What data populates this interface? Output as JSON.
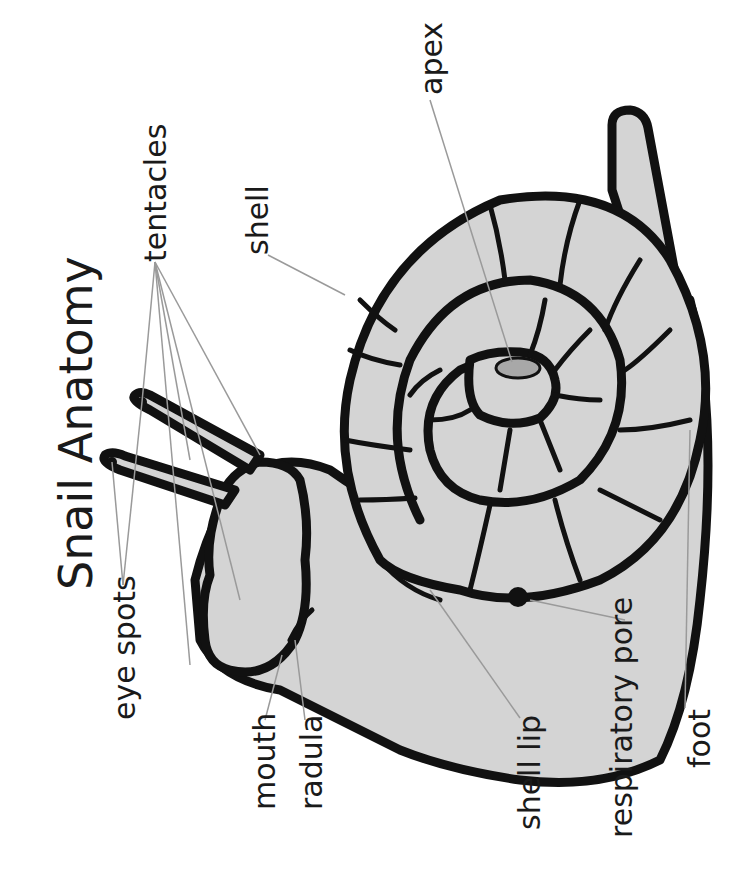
{
  "title": "Snail Anatomy",
  "labels": {
    "tentacles": "tentacles",
    "shell": "shell",
    "apex": "apex",
    "eye_spots": "eye spots",
    "mouth": "mouth",
    "radula": "radula",
    "shell_lip": "shell lip",
    "respiratory_pore": "respiratory pore",
    "foot": "foot"
  },
  "colors": {
    "body_fill": "#d4d4d4",
    "outline": "#111111",
    "apex_fill": "#a8a8a8",
    "leader": "#9a9a9a"
  }
}
